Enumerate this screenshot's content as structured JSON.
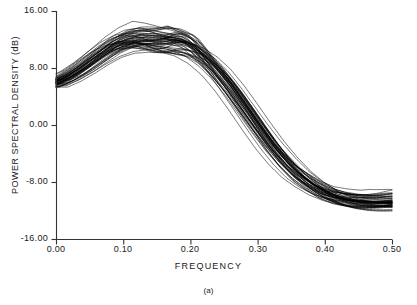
{
  "figure": {
    "caption": "(a)",
    "background_color": "#ffffff",
    "line_color": "#000000"
  },
  "chart_data": {
    "type": "line",
    "title": "",
    "subtitle": "",
    "xlabel": "FREQUENCY",
    "ylabel": "POWER SPECTRAL DENSITY (dB)",
    "annotation": "(a)",
    "grid": false,
    "legend": null,
    "legend_position": "none",
    "xlim": [
      0.0,
      0.5
    ],
    "ylim": [
      -16.0,
      16.0
    ],
    "xticks": [
      0.0,
      0.1,
      0.2,
      0.3,
      0.4,
      0.5
    ],
    "xtick_labels": [
      "0.00",
      "0.10",
      "0.20",
      "0.30",
      "0.40",
      "0.50"
    ],
    "yticks": [
      16.0,
      8.0,
      0.0,
      -8.0,
      -16.0
    ],
    "ytick_labels": [
      "16.00",
      "8.00",
      "0.00",
      "-8.00",
      "-16.00"
    ],
    "n_series": 50,
    "x": [
      0.0,
      0.02,
      0.04,
      0.06,
      0.08,
      0.1,
      0.12,
      0.14,
      0.16,
      0.18,
      0.2,
      0.22,
      0.24,
      0.26,
      0.28,
      0.3,
      0.32,
      0.34,
      0.36,
      0.38,
      0.4,
      0.42,
      0.44,
      0.46,
      0.48,
      0.5
    ],
    "envelope": {
      "upper": [
        8.8,
        9.6,
        10.7,
        12.0,
        13.3,
        14.2,
        14.5,
        14.3,
        13.8,
        13.3,
        12.6,
        11.3,
        9.4,
        7.0,
        4.3,
        1.5,
        -1.2,
        -3.6,
        -5.6,
        -7.1,
        -8.2,
        -9.0,
        -9.4,
        -9.6,
        -9.5,
        -9.2
      ],
      "mean": [
        5.9,
        6.8,
        8.0,
        9.4,
        10.7,
        11.6,
        12.0,
        11.9,
        11.6,
        11.2,
        10.5,
        9.2,
        7.4,
        5.1,
        2.5,
        -0.2,
        -2.8,
        -5.1,
        -7.0,
        -8.4,
        -9.5,
        -10.2,
        -10.6,
        -10.8,
        -10.8,
        -10.7
      ],
      "lower": [
        3.4,
        4.3,
        5.5,
        7.0,
        8.4,
        9.4,
        9.9,
        9.9,
        9.6,
        9.2,
        8.6,
        7.3,
        5.5,
        3.2,
        0.6,
        -2.1,
        -4.6,
        -6.9,
        -8.7,
        -10.1,
        -11.2,
        -11.9,
        -12.4,
        -12.6,
        -12.7,
        -12.6
      ]
    },
    "series": [
      {
        "name": "estimate-1",
        "values": [
          5.4,
          6.3,
          7.6,
          9.1,
          10.6,
          11.6,
          12.1,
          12.0,
          11.6,
          11.1,
          10.4,
          9.0,
          7.1,
          4.8,
          2.2,
          -0.5,
          -3.1,
          -5.4,
          -7.2,
          -8.6,
          -9.6,
          -10.3,
          -10.7,
          -10.9,
          -10.9,
          -10.8
        ]
      },
      {
        "name": "estimate-2",
        "values": [
          6.4,
          7.3,
          8.5,
          9.9,
          11.2,
          12.1,
          12.5,
          12.3,
          11.9,
          11.4,
          10.7,
          9.4,
          7.6,
          5.3,
          2.7,
          0.0,
          -2.6,
          -4.9,
          -6.8,
          -8.2,
          -9.3,
          -10.0,
          -10.4,
          -10.6,
          -10.6,
          -10.5
        ]
      },
      {
        "name": "estimate-3",
        "values": [
          4.3,
          5.3,
          6.6,
          8.2,
          9.7,
          10.7,
          11.2,
          11.2,
          10.9,
          10.5,
          9.8,
          8.5,
          6.7,
          4.4,
          1.8,
          -0.9,
          -3.5,
          -5.8,
          -7.6,
          -9.0,
          -10.1,
          -10.8,
          -11.2,
          -11.4,
          -11.4,
          -11.3
        ]
      },
      {
        "name": "estimate-4",
        "values": [
          7.4,
          8.2,
          9.4,
          10.7,
          12.0,
          12.8,
          13.1,
          12.9,
          12.5,
          11.9,
          11.2,
          9.8,
          7.9,
          5.6,
          2.9,
          0.2,
          -2.4,
          -4.7,
          -6.6,
          -8.0,
          -9.1,
          -9.8,
          -10.2,
          -10.4,
          -10.4,
          -10.3
        ]
      },
      {
        "name": "estimate-5",
        "values": [
          3.8,
          4.8,
          6.1,
          7.7,
          9.2,
          10.2,
          10.8,
          10.8,
          10.5,
          10.1,
          9.4,
          8.1,
          6.3,
          4.0,
          1.4,
          -1.3,
          -3.9,
          -6.2,
          -8.0,
          -9.4,
          -10.5,
          -11.2,
          -11.6,
          -11.8,
          -11.8,
          -11.7
        ]
      },
      {
        "name": "estimate-6",
        "values": [
          6.0,
          6.9,
          8.2,
          9.7,
          11.1,
          12.0,
          12.4,
          12.3,
          11.9,
          11.5,
          10.8,
          9.5,
          7.7,
          5.4,
          2.8,
          0.1,
          -2.5,
          -4.8,
          -6.7,
          -8.1,
          -9.2,
          -9.9,
          -10.3,
          -10.5,
          -10.5,
          -10.4
        ]
      },
      {
        "name": "estimate-7",
        "values": [
          5.0,
          6.0,
          7.3,
          8.9,
          10.3,
          11.3,
          11.8,
          11.8,
          11.5,
          11.0,
          10.3,
          9.0,
          7.2,
          4.9,
          2.3,
          -0.4,
          -3.0,
          -5.3,
          -7.2,
          -8.6,
          -9.7,
          -10.4,
          -10.8,
          -11.0,
          -11.0,
          -10.9
        ]
      },
      {
        "name": "estimate-8",
        "values": [
          6.8,
          7.7,
          8.9,
          10.3,
          11.6,
          12.4,
          12.8,
          12.6,
          12.2,
          11.7,
          11.0,
          9.6,
          7.8,
          5.5,
          2.8,
          0.1,
          -2.5,
          -4.8,
          -6.7,
          -8.1,
          -9.2,
          -9.9,
          -10.3,
          -10.5,
          -10.5,
          -10.4
        ]
      },
      {
        "name": "estimate-9",
        "values": [
          4.7,
          5.6,
          6.9,
          8.5,
          9.9,
          10.9,
          11.4,
          11.4,
          11.1,
          10.7,
          10.0,
          8.7,
          6.9,
          4.6,
          2.0,
          -0.7,
          -3.3,
          -5.6,
          -7.5,
          -8.9,
          -10.0,
          -10.7,
          -11.1,
          -11.3,
          -11.3,
          -11.2
        ]
      },
      {
        "name": "estimate-10",
        "values": [
          5.7,
          6.6,
          7.9,
          9.4,
          10.8,
          11.7,
          12.2,
          12.1,
          11.7,
          11.3,
          10.6,
          9.3,
          7.5,
          5.2,
          2.6,
          -0.1,
          -2.7,
          -5.0,
          -6.9,
          -8.3,
          -9.4,
          -10.1,
          -10.5,
          -10.7,
          -10.7,
          -10.6
        ]
      }
    ]
  },
  "axes": {
    "x": {
      "label": "FREQUENCY",
      "ticks": [
        {
          "value": 0.0,
          "label": "0.00"
        },
        {
          "value": 0.1,
          "label": "0.10"
        },
        {
          "value": 0.2,
          "label": "0.20"
        },
        {
          "value": 0.3,
          "label": "0.30"
        },
        {
          "value": 0.4,
          "label": "0.40"
        },
        {
          "value": 0.5,
          "label": "0.50"
        }
      ]
    },
    "y": {
      "label": "POWER SPECTRAL DENSITY (dB)",
      "ticks": [
        {
          "value": 16.0,
          "label": "16.00"
        },
        {
          "value": 8.0,
          "label": "8.00"
        },
        {
          "value": 0.0,
          "label": "0.00"
        },
        {
          "value": -8.0,
          "label": "-8.00"
        },
        {
          "value": -16.0,
          "label": "-16.00"
        }
      ]
    }
  }
}
